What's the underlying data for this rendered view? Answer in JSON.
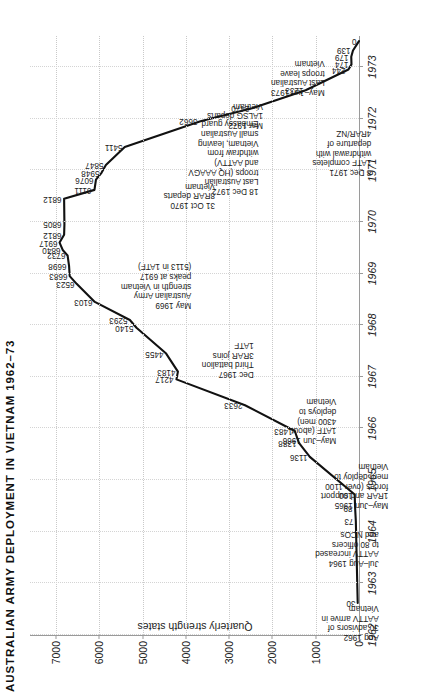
{
  "figure": {
    "title": "AUSTRALIAN ARMY DEPLOYMENT IN VIETNAM 1962–73",
    "ylabel": "Quarterly strength states"
  },
  "chart_data": {
    "type": "line",
    "title": "AUSTRALIAN ARMY DEPLOYMENT IN VIETNAM 1962–73",
    "xlabel": "",
    "ylabel": "Quarterly strength states",
    "xlim": [
      1962.0,
      1973.6
    ],
    "ylim": [
      0,
      7600
    ],
    "yticks": [
      0,
      1000,
      2000,
      3000,
      4000,
      5000,
      6000,
      7000
    ],
    "ytick_labels": [
      "0",
      "1000",
      "2000",
      "3000",
      "4000",
      "5000",
      "6000",
      "7000"
    ],
    "xticks": [
      1962,
      1963,
      1964,
      1965,
      1966,
      1967,
      1968,
      1969,
      1970,
      1971,
      1972,
      1973
    ],
    "xtick_labels": [
      "1962",
      "1963",
      "1964",
      "1965",
      "1966",
      "1967",
      "1968",
      "1969",
      "1970",
      "1971",
      "1972",
      "1973"
    ],
    "grid": "dotted both axes",
    "legend": "none",
    "series": [
      {
        "name": "Quarterly strength states",
        "color": "#111111",
        "points": [
          {
            "x": 1962.62,
            "y": 30,
            "label": "30"
          },
          {
            "x": 1964.2,
            "y": 73,
            "label": "73"
          },
          {
            "x": 1964.45,
            "y": 89,
            "label": "89"
          },
          {
            "x": 1964.72,
            "y": 100,
            "label": "100"
          },
          {
            "x": 1965.45,
            "y": 1136,
            "label": "1136"
          },
          {
            "x": 1965.72,
            "y": 1388,
            "label": "1388"
          },
          {
            "x": 1965.95,
            "y": 1483,
            "label": "1483"
          },
          {
            "x": 1966.45,
            "y": 2633,
            "label": "2633"
          },
          {
            "x": 1966.95,
            "y": 4217,
            "label": "4217"
          },
          {
            "x": 1967.1,
            "y": 4183,
            "label": "4183"
          },
          {
            "x": 1967.45,
            "y": 4455,
            "label": "4455"
          },
          {
            "x": 1967.95,
            "y": 5140,
            "label": "5140"
          },
          {
            "x": 1968.1,
            "y": 5293,
            "label": "5293"
          },
          {
            "x": 1968.45,
            "y": 6103,
            "label": "6103"
          },
          {
            "x": 1968.8,
            "y": 6523,
            "label": "6523"
          },
          {
            "x": 1968.95,
            "y": 6683,
            "label": "6683"
          },
          {
            "x": 1969.15,
            "y": 6698,
            "label": "6698"
          },
          {
            "x": 1969.35,
            "y": 6732,
            "label": "6732"
          },
          {
            "x": 1969.45,
            "y": 6840,
            "label": "6840"
          },
          {
            "x": 1969.6,
            "y": 6917,
            "label": "6917"
          },
          {
            "x": 1969.75,
            "y": 6812,
            "label": "6812"
          },
          {
            "x": 1969.95,
            "y": 6805,
            "label": "6805"
          },
          {
            "x": 1970.45,
            "y": 6812,
            "label": "6812"
          },
          {
            "x": 1970.62,
            "y": 6111,
            "label": "6111"
          },
          {
            "x": 1970.82,
            "y": 6076,
            "label": "6076"
          },
          {
            "x": 1970.95,
            "y": 5948,
            "label": "5948"
          },
          {
            "x": 1971.1,
            "y": 5847,
            "label": "5847"
          },
          {
            "x": 1971.45,
            "y": 5411,
            "label": "5411"
          },
          {
            "x": 1971.95,
            "y": 3662,
            "label": "3662"
          },
          {
            "x": 1972.2,
            "y": 2470,
            "label": "2470"
          },
          {
            "x": 1972.55,
            "y": 1233,
            "label": "1233"
          },
          {
            "x": 1972.95,
            "y": 244,
            "label": "244"
          },
          {
            "x": 1973.05,
            "y": 174,
            "label": "174"
          },
          {
            "x": 1973.2,
            "y": 179,
            "label": "179"
          },
          {
            "x": 1973.32,
            "y": 139,
            "label": "139"
          },
          {
            "x": 1973.5,
            "y": 0,
            "label": "0"
          }
        ]
      }
    ],
    "annotations": [
      {
        "id": "aug-1962",
        "x": 1962.62,
        "y": 430,
        "lines": [
          "Aug 1962",
          "30 advisors of",
          "AATTV arrive in",
          "Vietnam"
        ]
      },
      {
        "id": "jul-aug-1964",
        "x": 1964.05,
        "y": 430,
        "lines": [
          "Jul–Aug 1964",
          "AATTV increased",
          "to 80 officers",
          "and NCOs"
        ]
      },
      {
        "id": "may-jun-1965",
        "x": 1965.35,
        "y": 430,
        "lines": [
          "May–Jun 1965",
          "1RAR and support",
          "forces (over 1100",
          "men) deploy to",
          "Vietnam"
        ]
      },
      {
        "id": "may-jun-1966",
        "x": 1966.6,
        "y": 1640,
        "lines": [
          "May–Jun 1966",
          "1ATF (about",
          "4300 men)",
          "deploys to",
          "Vietnam"
        ]
      },
      {
        "id": "dec-1967",
        "x": 1967.72,
        "y": 3320,
        "lines": [
          "Dec 1967",
          "Third battalion",
          "3RAR joins",
          "1ATF"
        ]
      },
      {
        "id": "may-1969",
        "x": 1969.22,
        "y": 5000,
        "lines": [
          "May 1969",
          "Australian Army",
          "strength in Vietnam",
          "peaks at 6917",
          "(5113 in 1ATF)"
        ]
      },
      {
        "id": "oct-1970",
        "x": 1970.8,
        "y": 3990,
        "lines": [
          "31 Oct 1970",
          "8RAR departs",
          "Vietnam"
        ]
      },
      {
        "id": "dec-1971",
        "x": 1971.8,
        "y": 830,
        "lines": [
          "8 Dec 1971",
          "1ATF completes",
          "withdrawal with",
          "departure of",
          "4RAR/NZ"
        ]
      },
      {
        "id": "mar-1972",
        "x": 1972.35,
        "y": 2880,
        "lines": [
          "Mar 1972",
          "1ALSG departs",
          "Vietnam"
        ]
      },
      {
        "id": "dec-1972",
        "x": 1972.0,
        "y": 4120,
        "lines": [
          "18 Dec 1972",
          "Last Australian",
          "troops (HQ AAAGV",
          "and AATTV)",
          "withdraw from",
          "Vietnam, leaving",
          "small Australian",
          "Embassy guard"
        ]
      },
      {
        "id": "may-jun-1973",
        "x": 1973.18,
        "y": 1680,
        "lines": [
          "May–Jun 1973",
          "Last Australian",
          "troops leave",
          "Vietnam"
        ]
      }
    ]
  }
}
